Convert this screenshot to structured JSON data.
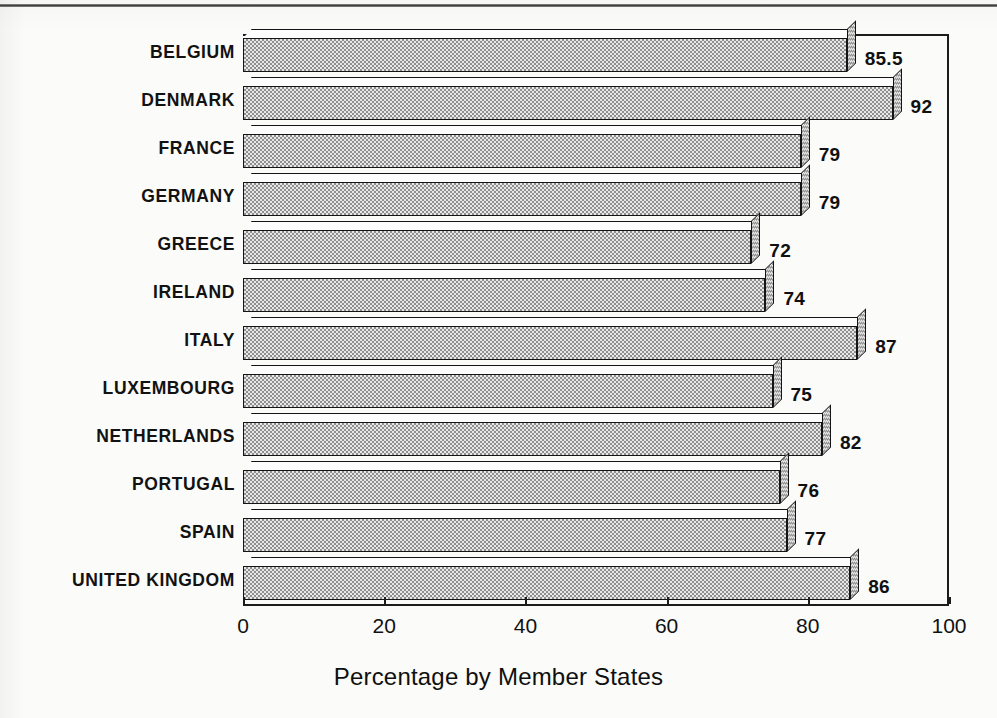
{
  "chart_data": {
    "type": "bar",
    "orientation": "horizontal",
    "title": "",
    "xlabel": "Percentage by Member States",
    "ylabel": "",
    "xlim": [
      0,
      100
    ],
    "xticks": [
      "0",
      "20",
      "40",
      "60",
      "80",
      "100"
    ],
    "grid": false,
    "legend": null,
    "style": "3d-bar",
    "categories": [
      "BELGIUM",
      "DENMARK",
      "FRANCE",
      "GERMANY",
      "GREECE",
      "IRELAND",
      "ITALY",
      "LUXEMBOURG",
      "NETHERLANDS",
      "PORTUGAL",
      "SPAIN",
      "UNITED KINGDOM"
    ],
    "values": [
      85.5,
      92,
      79,
      79,
      72,
      74,
      87,
      75,
      82,
      76,
      77,
      86
    ],
    "value_labels": [
      "85.5",
      "92",
      "79",
      "79",
      "72",
      "74",
      "87",
      "75",
      "82",
      "76",
      "77",
      "86"
    ]
  },
  "colors": {
    "page_background": "#fbfbf9",
    "bar_fill": "#c9c9c9",
    "bar_outline": "#141414",
    "axis": "#1c1c1c",
    "text": "#111111"
  }
}
